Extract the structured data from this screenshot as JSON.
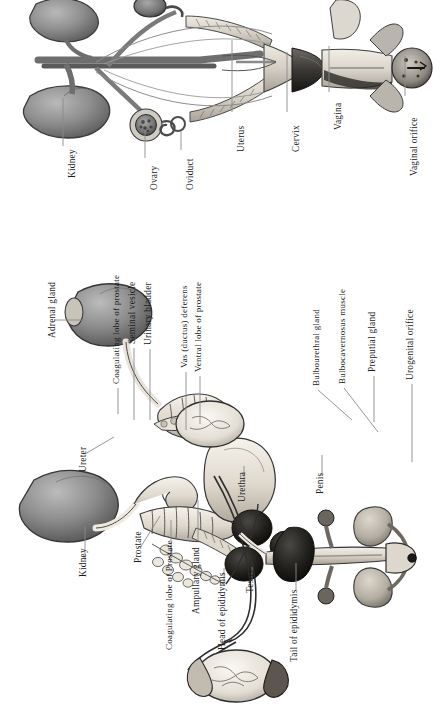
{
  "document": {
    "type": "anatomical-illustration",
    "title": "Reproductive tracts of the laboratory rodent",
    "panels": [
      "female-reproductive-tract",
      "male-reproductive-tract"
    ],
    "ink_color": "#1b1b1b",
    "paper_color": "#ffffff",
    "leader_color": "#8a8a8a"
  },
  "female_panel": {
    "name": "Female reproductive tract",
    "labels": [
      {
        "id": "kidney",
        "text": "Kidney",
        "x": 68,
        "y": 178,
        "leader": {
          "x1": 63,
          "y1": 98,
          "x2": 63,
          "y2": 146
        }
      },
      {
        "id": "ovary",
        "text": "Ovary",
        "x": 150,
        "y": 190,
        "leader": {
          "x1": 145,
          "y1": 130,
          "x2": 145,
          "y2": 158
        }
      },
      {
        "id": "oviduct",
        "text": "Oviduct",
        "x": 186,
        "y": 190,
        "leader": {
          "x1": 181,
          "y1": 132,
          "x2": 181,
          "y2": 150
        }
      },
      {
        "id": "uterus",
        "text": "Uterus",
        "x": 237,
        "y": 152,
        "leader": {
          "x1": 232,
          "y1": 40,
          "x2": 232,
          "y2": 112
        }
      },
      {
        "id": "cervix",
        "text": "Cervix",
        "x": 292,
        "y": 152,
        "leader": {
          "x1": 287,
          "y1": 52,
          "x2": 287,
          "y2": 112
        }
      },
      {
        "id": "vagina",
        "text": "Vagina",
        "x": 334,
        "y": 130,
        "leader": {
          "x1": 329,
          "y1": 46,
          "x2": 329,
          "y2": 92
        }
      },
      {
        "id": "vaginal-orifice",
        "text": "Vaginal orifice",
        "x": 410,
        "y": 176,
        "leader": {
          "x1": 405,
          "y1": 56,
          "x2": 405,
          "y2": 96
        }
      }
    ]
  },
  "male_panel": {
    "name": "Male reproductive tract",
    "labels": [
      {
        "id": "adrenal-gland",
        "text": "Adrenal gland",
        "x": 48,
        "y": 338,
        "leader": {
          "x1": 54,
          "y1": 320,
          "x2": 84,
          "y2": 320
        }
      },
      {
        "id": "ureter",
        "text": "Ureter",
        "x": 79,
        "y": 472,
        "leader": {
          "x1": 85,
          "y1": 454,
          "x2": 114,
          "y2": 437
        }
      },
      {
        "id": "kidney-male",
        "text": "Kidney",
        "x": 79,
        "y": 577,
        "leader": {
          "x1": 85,
          "y1": 560,
          "x2": 85,
          "y2": 527
        }
      },
      {
        "id": "coagulating-lobe-prostate",
        "text": "Coagulating lobe of prostate",
        "x": 112,
        "y": 384,
        "leader": {
          "x1": 118,
          "y1": 388,
          "x2": 118,
          "y2": 414
        }
      },
      {
        "id": "seminal-vesicle",
        "text": "Seminal vesicle",
        "x": 128,
        "y": 344,
        "leader": {
          "x1": 134,
          "y1": 348,
          "x2": 134,
          "y2": 420
        }
      },
      {
        "id": "urinary-bladder",
        "text": "Urinary bladder",
        "x": 144,
        "y": 345,
        "leader": {
          "x1": 150,
          "y1": 349,
          "x2": 150,
          "y2": 420
        }
      },
      {
        "id": "prostate",
        "text": "Prostate",
        "x": 134,
        "y": 563,
        "leader": {
          "x1": 140,
          "y1": 548,
          "x2": 160,
          "y2": 516
        }
      },
      {
        "id": "vas-deferens",
        "text": "Vas (ductus) deferens",
        "x": 180,
        "y": 368,
        "leader": {
          "x1": 186,
          "y1": 372,
          "x2": 186,
          "y2": 430
        }
      },
      {
        "id": "ventral-lobe-prostate",
        "text": "Ventral lobe of prostate",
        "x": 194,
        "y": 372,
        "leader": {
          "x1": 200,
          "y1": 376,
          "x2": 200,
          "y2": 424
        }
      },
      {
        "id": "coagulating-lobe-Prostate2",
        "text": "Coagulating lobe of Prostate",
        "x": 165,
        "y": 650,
        "leader": {
          "x1": 171,
          "y1": 520,
          "x2": 171,
          "y2": 556
        }
      },
      {
        "id": "ampullary-gland",
        "text": "Ampullary gland",
        "x": 192,
        "y": 614,
        "leader": {
          "x1": 198,
          "y1": 500,
          "x2": 198,
          "y2": 540
        }
      },
      {
        "id": "head-of-epididymis",
        "text": "Head of epididymis",
        "x": 218,
        "y": 650,
        "leader": {
          "x1": 224,
          "y1": 568,
          "x2": 224,
          "y2": 586
        }
      },
      {
        "id": "testis",
        "text": "Testis",
        "x": 246,
        "y": 593,
        "leader": {
          "x1": 252,
          "y1": 567,
          "x2": 252,
          "y2": 580
        }
      },
      {
        "id": "tail-of-epididymis",
        "text": "Tail of epididymis",
        "x": 290,
        "y": 662,
        "leader": {
          "x1": 296,
          "y1": 563,
          "x2": 296,
          "y2": 590
        }
      },
      {
        "id": "urethra",
        "text": "Urethra",
        "x": 238,
        "y": 502,
        "leader": {
          "x1": 244,
          "y1": 466,
          "x2": 244,
          "y2": 482
        }
      },
      {
        "id": "penis",
        "text": "Penis",
        "x": 316,
        "y": 494,
        "leader": {
          "x1": 322,
          "y1": 455,
          "x2": 322,
          "y2": 476
        }
      },
      {
        "id": "bulbourethral-gland",
        "text": "Bulbourethral gland",
        "x": 312,
        "y": 386,
        "leader": {
          "x1": 318,
          "y1": 390,
          "x2": 352,
          "y2": 420
        }
      },
      {
        "id": "bulbocavernosus-muscle",
        "text": "Bulbocavernosus muscle",
        "x": 338,
        "y": 384,
        "leader": {
          "x1": 344,
          "y1": 388,
          "x2": 378,
          "y2": 432
        }
      },
      {
        "id": "preputial-gland",
        "text": "Preputial gland",
        "x": 368,
        "y": 372,
        "leader": {
          "x1": 374,
          "y1": 376,
          "x2": 374,
          "y2": 422
        }
      },
      {
        "id": "urogenital-orifice",
        "text": "Urogenital orifice",
        "x": 406,
        "y": 380,
        "leader": {
          "x1": 412,
          "y1": 384,
          "x2": 412,
          "y2": 462
        }
      }
    ]
  }
}
